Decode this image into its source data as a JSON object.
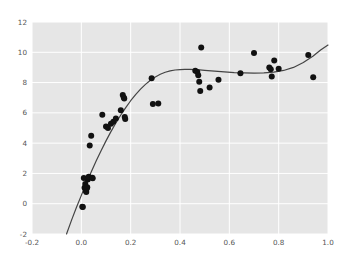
{
  "chart_data": {
    "type": "scatter",
    "title": "",
    "xlabel": "",
    "ylabel": "",
    "xlim": [
      -0.2,
      1.0
    ],
    "ylim": [
      -2,
      12
    ],
    "grid": true,
    "legend": null,
    "xticks": [
      -0.2,
      0.0,
      0.2,
      0.4,
      0.6,
      0.8,
      1.0
    ],
    "xtick_labels": [
      "-0.2",
      "0.0",
      "0.2",
      "0.4",
      "0.6",
      "0.8",
      "1.0"
    ],
    "yticks": [
      -2,
      0,
      2,
      4,
      6,
      8,
      10,
      12
    ],
    "ytick_labels": [
      "-2",
      "0",
      "2",
      "4",
      "6",
      "8",
      "10",
      "12"
    ],
    "style": {
      "axes_facecolor": "#e6e6e6",
      "figure_facecolor": "#ffffff",
      "grid_color": "#ffffff",
      "marker_color": "#111111",
      "line_color": "#444444",
      "tick_label_color": "#555555",
      "marker_size": 3.0,
      "line_width": 1.2
    },
    "series": [
      {
        "name": "observations",
        "type": "scatter",
        "x": [
          0.004,
          0.006,
          0.01,
          0.013,
          0.016,
          0.018,
          0.02,
          0.022,
          0.024,
          0.026,
          0.03,
          0.034,
          0.04,
          0.044,
          0.046,
          0.085,
          0.1,
          0.108,
          0.12,
          0.13,
          0.14,
          0.16,
          0.168,
          0.172,
          0.174,
          0.176,
          0.178,
          0.285,
          0.29,
          0.312,
          0.462,
          0.47,
          0.474,
          0.478,
          0.482,
          0.486,
          0.52,
          0.556,
          0.645,
          0.7,
          0.762,
          0.768,
          0.772,
          0.782,
          0.8,
          0.92,
          0.94
        ],
        "y": [
          -0.2,
          -0.22,
          1.7,
          1.05,
          1.3,
          0.85,
          0.78,
          1.0,
          1.08,
          1.6,
          1.78,
          3.85,
          4.48,
          1.72,
          1.68,
          5.88,
          5.1,
          5.0,
          5.28,
          5.42,
          5.62,
          6.18,
          7.18,
          7.02,
          6.95,
          5.72,
          5.6,
          8.28,
          6.58,
          6.62,
          8.78,
          8.7,
          8.48,
          8.05,
          7.44,
          10.32,
          7.68,
          8.18,
          8.62,
          9.95,
          9.0,
          8.88,
          8.4,
          9.45,
          8.92,
          9.82,
          8.35
        ]
      },
      {
        "name": "fitted-curve",
        "type": "line",
        "x": [
          -0.06,
          -0.04,
          -0.02,
          0.0,
          0.02,
          0.04,
          0.06,
          0.08,
          0.1,
          0.12,
          0.14,
          0.16,
          0.18,
          0.2,
          0.22,
          0.24,
          0.26,
          0.28,
          0.3,
          0.32,
          0.34,
          0.36,
          0.38,
          0.4,
          0.42,
          0.44,
          0.46,
          0.48,
          0.5,
          0.54,
          0.58,
          0.62,
          0.66,
          0.7,
          0.74,
          0.78,
          0.82,
          0.86,
          0.9,
          0.94,
          0.97,
          1.0
        ],
        "y": [
          -2.0,
          -1.1,
          -0.25,
          0.55,
          1.35,
          2.1,
          2.82,
          3.5,
          4.15,
          4.76,
          5.33,
          5.86,
          6.35,
          6.8,
          7.21,
          7.57,
          7.88,
          8.15,
          8.37,
          8.55,
          8.68,
          8.77,
          8.83,
          8.86,
          8.87,
          8.87,
          8.86,
          8.84,
          8.81,
          8.75,
          8.7,
          8.66,
          8.64,
          8.63,
          8.64,
          8.69,
          8.8,
          9.0,
          9.32,
          9.76,
          10.15,
          10.48
        ]
      }
    ]
  }
}
